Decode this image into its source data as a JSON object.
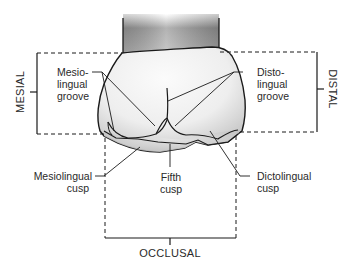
{
  "figure": {
    "orientation_labels": {
      "mesial": "MESIAL",
      "distal": "DISTAL",
      "occlusal": "OCCLUSAL"
    },
    "annotations": [
      {
        "id": "mesiolingual-groove",
        "lines": [
          "Mesio-",
          "lingual",
          "groove"
        ]
      },
      {
        "id": "distolingual-groove",
        "lines": [
          "Disto-",
          "lingual",
          "groove"
        ]
      },
      {
        "id": "mesiolingual-cusp",
        "lines": [
          "Mesiolingual",
          "cusp"
        ]
      },
      {
        "id": "fifth-cusp",
        "lines": [
          "Fifth",
          "cusp"
        ]
      },
      {
        "id": "distolingual-cusp",
        "lines": [
          "Dictolingual",
          "cusp"
        ]
      }
    ],
    "colors": {
      "line": "#1a1a1a",
      "text": "#2a2a2a",
      "root_dark": "#7a7a7a",
      "root_light": "#d8d8d8",
      "crown_light": "#f4f4f4",
      "crown_shade": "#c9c9c9"
    }
  }
}
